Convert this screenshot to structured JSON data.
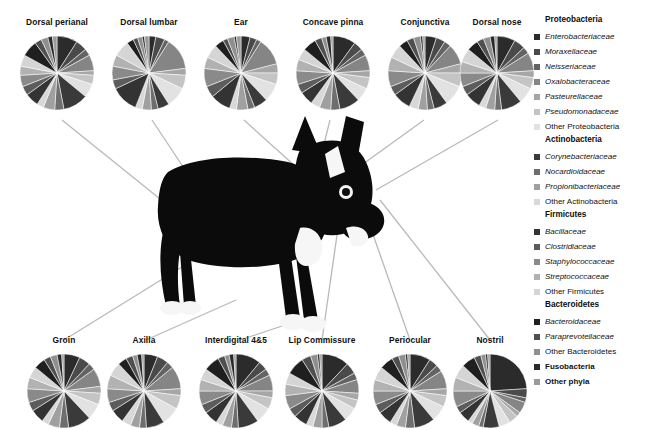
{
  "figure": {
    "dog_photo_alt": "black-and-white dog photograph"
  },
  "legend": {
    "groups": [
      {
        "header": "Proteobacteria",
        "items": [
          {
            "label": "Enterobacteriaceae",
            "color": "#2b2b2b",
            "italic": true,
            "bold": false
          },
          {
            "label": "Moraxellaceae",
            "color": "#4a4a4a",
            "italic": true,
            "bold": false
          },
          {
            "label": "Neisseriaceae",
            "color": "#636363",
            "italic": true,
            "bold": false
          },
          {
            "label": "Oxalobacteraceae",
            "color": "#858585",
            "italic": true,
            "bold": false
          },
          {
            "label": "Pasteurellaceae",
            "color": "#a6a6a6",
            "italic": true,
            "bold": false
          },
          {
            "label": "Pseudomonadaceae",
            "color": "#c4c4c4",
            "italic": true,
            "bold": false
          },
          {
            "label": "Other Proteobacteria",
            "color": "#e2e2e2",
            "italic": false,
            "bold": false
          }
        ]
      },
      {
        "header": "Actinobacteria",
        "items": [
          {
            "label": "Corynebacteriaceae",
            "color": "#3a3a3a",
            "italic": true,
            "bold": false
          },
          {
            "label": "Nocardioidaceae",
            "color": "#6e6e6e",
            "italic": true,
            "bold": false
          },
          {
            "label": "Propionibacteriaceae",
            "color": "#a0a0a0",
            "italic": true,
            "bold": false
          },
          {
            "label": "Other Actinobacteria",
            "color": "#d8d8d8",
            "italic": false,
            "bold": false
          }
        ]
      },
      {
        "header": "Firmicutes",
        "items": [
          {
            "label": "Bacillaceae",
            "color": "#333333",
            "italic": true,
            "bold": false
          },
          {
            "label": "Clostridiaceae",
            "color": "#5c5c5c",
            "italic": true,
            "bold": false
          },
          {
            "label": "Staphylococcaceae",
            "color": "#8a8a8a",
            "italic": true,
            "bold": false
          },
          {
            "label": "Streptococcaceae",
            "color": "#b2b2b2",
            "italic": true,
            "bold": false
          },
          {
            "label": "Other Firmicutes",
            "color": "#d5d5d5",
            "italic": false,
            "bold": false
          }
        ]
      },
      {
        "header": "Bacteroidetes",
        "items": [
          {
            "label": "Bacteroidaceae",
            "color": "#1f1f1f",
            "italic": true,
            "bold": false
          },
          {
            "label": "Paraprevotellaceae",
            "color": "#4f4f4f",
            "italic": true,
            "bold": false
          },
          {
            "label": "Other Bacteroidetes",
            "color": "#8f8f8f",
            "italic": false,
            "bold": false
          }
        ]
      },
      {
        "header": "",
        "items": [
          {
            "label": "Fusobacteria",
            "color": "#2a2a2a",
            "italic": false,
            "bold": true
          },
          {
            "label": "Other phyla",
            "color": "#9a9a9a",
            "italic": false,
            "bold": true
          }
        ]
      }
    ]
  },
  "chart_data": {
    "type": "pie",
    "legend_position": "right",
    "categories": [
      "Enterobacteriaceae",
      "Moraxellaceae",
      "Neisseriaceae",
      "Oxalobacteraceae",
      "Pasteurellaceae",
      "Pseudomonadaceae",
      "Other Proteobacteria",
      "Corynebacteriaceae",
      "Nocardioidaceae",
      "Propionibacteriaceae",
      "Other Actinobacteria",
      "Bacillaceae",
      "Clostridiaceae",
      "Staphylococcaceae",
      "Streptococcaceae",
      "Other Firmicutes",
      "Bacteroidaceae",
      "Paraprevotellaceae",
      "Other Bacteroidetes",
      "Fusobacteria",
      "Other phyla"
    ],
    "colors": [
      "#2b2b2b",
      "#4a4a4a",
      "#636363",
      "#858585",
      "#a6a6a6",
      "#c4c4c4",
      "#e2e2e2",
      "#3a3a3a",
      "#6e6e6e",
      "#a0a0a0",
      "#d8d8d8",
      "#333333",
      "#5c5c5c",
      "#8a8a8a",
      "#b2b2b2",
      "#d5d5d5",
      "#1f1f1f",
      "#4f4f4f",
      "#8f8f8f",
      "#2a2a2a",
      "#9a9a9a"
    ],
    "charts": [
      {
        "label": "Dorsal perianal",
        "row": "top",
        "x": 57,
        "y": 75,
        "values": [
          9,
          5,
          3,
          7,
          2,
          4,
          6,
          11,
          4,
          5,
          3,
          6,
          4,
          5,
          4,
          5,
          7,
          3,
          3,
          2,
          2
        ]
      },
      {
        "label": "Dorsal lumbar",
        "row": "top",
        "x": 149,
        "y": 75,
        "values": [
          3,
          4,
          2,
          14,
          3,
          6,
          9,
          5,
          3,
          4,
          3,
          12,
          4,
          6,
          5,
          7,
          3,
          2,
          2,
          1,
          2
        ]
      },
      {
        "label": "Ear",
        "row": "top",
        "x": 241,
        "y": 75,
        "values": [
          4,
          3,
          2,
          12,
          4,
          5,
          8,
          6,
          3,
          5,
          3,
          9,
          5,
          8,
          5,
          6,
          4,
          2,
          3,
          1,
          2
        ]
      },
      {
        "label": "Concave pinna",
        "row": "top",
        "x": 333,
        "y": 75,
        "values": [
          10,
          4,
          3,
          7,
          3,
          5,
          6,
          9,
          4,
          5,
          4,
          6,
          4,
          6,
          5,
          5,
          6,
          3,
          2,
          2,
          1
        ]
      },
      {
        "label": "Conjunctiva",
        "row": "top",
        "x": 425,
        "y": 75,
        "values": [
          5,
          4,
          3,
          9,
          4,
          6,
          9,
          6,
          3,
          4,
          4,
          8,
          4,
          7,
          6,
          6,
          4,
          3,
          3,
          1,
          1
        ]
      },
      {
        "label": "Dorsal nose",
        "row": "top",
        "x": 497,
        "y": 75,
        "values": [
          8,
          5,
          3,
          8,
          3,
          5,
          7,
          9,
          3,
          4,
          3,
          7,
          4,
          6,
          5,
          6,
          5,
          3,
          3,
          2,
          1
        ]
      },
      {
        "label": "Groin",
        "row": "bottom",
        "x": 64,
        "y": 389,
        "values": [
          7,
          5,
          3,
          8,
          3,
          5,
          7,
          10,
          4,
          5,
          3,
          6,
          4,
          6,
          5,
          5,
          5,
          3,
          3,
          2,
          1
        ]
      },
      {
        "label": "Axilla",
        "row": "bottom",
        "x": 144,
        "y": 389,
        "values": [
          6,
          5,
          3,
          10,
          3,
          6,
          8,
          8,
          3,
          4,
          4,
          6,
          4,
          6,
          6,
          6,
          4,
          3,
          2,
          2,
          1
        ]
      },
      {
        "label": "Interdigital 4&5",
        "row": "bottom",
        "x": 236,
        "y": 389,
        "values": [
          11,
          4,
          3,
          7,
          3,
          5,
          7,
          9,
          3,
          4,
          3,
          6,
          4,
          6,
          5,
          5,
          7,
          3,
          2,
          2,
          1
        ]
      },
      {
        "label": "Lip Commissure",
        "x": 322,
        "row": "bottom",
        "y": 389,
        "values": [
          12,
          5,
          3,
          6,
          3,
          4,
          6,
          8,
          3,
          4,
          3,
          6,
          4,
          6,
          5,
          5,
          8,
          4,
          3,
          1,
          1
        ]
      },
      {
        "label": "Periocular",
        "row": "bottom",
        "x": 410,
        "y": 389,
        "values": [
          9,
          4,
          3,
          8,
          3,
          5,
          7,
          9,
          4,
          4,
          3,
          6,
          4,
          6,
          5,
          6,
          6,
          3,
          3,
          1,
          1
        ]
      },
      {
        "label": "Nostril",
        "row": "bottom",
        "x": 490,
        "y": 389,
        "values": [
          24,
          4,
          2,
          5,
          2,
          4,
          5,
          7,
          2,
          3,
          2,
          5,
          3,
          7,
          6,
          6,
          6,
          3,
          2,
          1,
          1
        ]
      }
    ]
  }
}
